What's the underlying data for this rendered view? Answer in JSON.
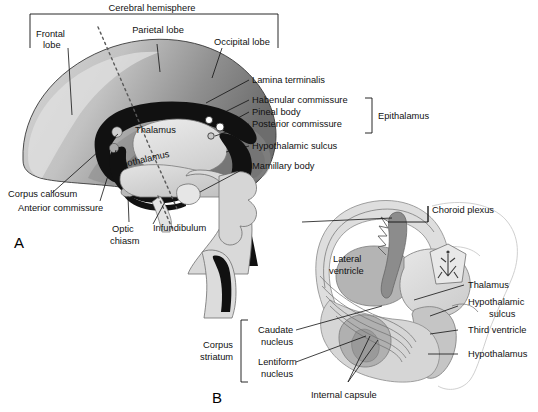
{
  "figure": {
    "title_top": "Cerebral hemisphere",
    "panels": [
      {
        "id": "A",
        "label": "A"
      },
      {
        "id": "B",
        "label": "B"
      }
    ]
  },
  "panel_a": {
    "panel_label": "A",
    "group_bracket_label": "Cerebral hemisphere",
    "epithalamus_bracket_label": "Epithalamus",
    "labels": [
      {
        "name": "frontal-lobe",
        "text_line1": "Frontal",
        "text_line2": "lobe"
      },
      {
        "name": "parietal-lobe",
        "text_line1": "Parietal lobe",
        "text_line2": ""
      },
      {
        "name": "occipital-lobe",
        "text_line1": "Occipital lobe",
        "text_line2": ""
      },
      {
        "name": "lamina-terminalis",
        "text_line1": "Lamina terminalis",
        "text_line2": ""
      },
      {
        "name": "habenular-commissure",
        "text_line1": "Habenular commissure",
        "text_line2": ""
      },
      {
        "name": "pineal-body",
        "text_line1": "Pineal body",
        "text_line2": ""
      },
      {
        "name": "posterior-commissure",
        "text_line1": "Posterior commissure",
        "text_line2": ""
      },
      {
        "name": "hypothalamic-sulcus",
        "text_line1": "Hypothalamic sulcus",
        "text_line2": ""
      },
      {
        "name": "mamillary-body",
        "text_line1": "Mamillary body",
        "text_line2": ""
      },
      {
        "name": "thalamus",
        "text_line1": "Thalamus",
        "text_line2": ""
      },
      {
        "name": "hypothalamus",
        "text_line1": "Hypothalamus",
        "text_line2": ""
      },
      {
        "name": "corpus-callosum",
        "text_line1": "Corpus callosum",
        "text_line2": ""
      },
      {
        "name": "anterior-commissure",
        "text_line1": "Anterior commissure",
        "text_line2": ""
      },
      {
        "name": "optic-chiasm",
        "text_line1": "Optic",
        "text_line2": "chiasm"
      },
      {
        "name": "infundibulum",
        "text_line1": "Infundibulum",
        "text_line2": ""
      }
    ],
    "text": {
      "frontal_lobe_1": "Frontal",
      "frontal_lobe_2": "lobe",
      "parietal_lobe": "Parietal lobe",
      "occipital_lobe": "Occipital lobe",
      "lamina_terminalis": "Lamina terminalis",
      "habenular_commissure": "Habenular commissure",
      "pineal_body": "Pineal body",
      "posterior_commissure": "Posterior commissure",
      "epithalamus": "Epithalamus",
      "hypothalamic_sulcus": "Hypothalamic sulcus",
      "mamillary_body": "Mamillary body",
      "thalamus": "Thalamus",
      "hypothalamus": "Hypothalamus",
      "corpus_callosum": "Corpus callosum",
      "anterior_commissure": "Anterior commissure",
      "optic_chiasm_1": "Optic",
      "optic_chiasm_2": "chiasm",
      "infundibulum": "Infundibulum",
      "cerebral_hemisphere": "Cerebral hemisphere",
      "panel_letter": "A"
    }
  },
  "panel_b": {
    "panel_label": "B",
    "corpus_striatum_bracket_label_1": "Corpus",
    "corpus_striatum_bracket_label_2": "striatum",
    "text": {
      "choroid_plexus": "Choroid plexus",
      "lateral_ventricle_1": "Lateral",
      "lateral_ventricle_2": "ventricle",
      "thalamus": "Thalamus",
      "hypothalamic_sulcus_1": "Hypothalamic",
      "hypothalamic_sulcus_2": "sulcus",
      "third_ventricle": "Third ventricle",
      "hypothalamus": "Hypothalamus",
      "caudate_nucleus_1": "Caudate",
      "caudate_nucleus_2": "nucleus",
      "lentiform_nucleus_1": "Lentiform",
      "lentiform_nucleus_2": "nucleus",
      "corpus_striatum_1": "Corpus",
      "corpus_striatum_2": "striatum",
      "internal_capsule": "Internal capsule",
      "panel_letter": "B"
    }
  },
  "colors": {
    "background": "#ffffff",
    "text": "#111111",
    "cortex_light": "#c8c8c8",
    "cortex_mid": "#9a9a9a",
    "cortex_dark": "#6a6a6a",
    "ventricle_black": "#111111",
    "pale_gray": "#d9d9d9",
    "mid_gray": "#bdbdbd",
    "choroid_gray": "#8f8f8f",
    "outline": "#2b2b2b",
    "faint_outline": "#c9c9c9",
    "dashed_line": "#5a5a5a"
  }
}
